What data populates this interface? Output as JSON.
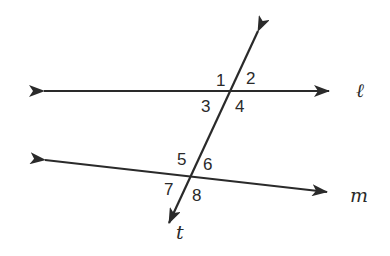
{
  "diagram": {
    "type": "parallel lines cut by a transversal",
    "lines": [
      {
        "name": "ℓ",
        "label": "ℓ",
        "from": [
          25,
          91
        ],
        "to": [
          348,
          91
        ],
        "arrows": "both"
      },
      {
        "name": "m",
        "label": "m",
        "from": [
          27,
          158
        ],
        "to": [
          345,
          194
        ],
        "arrows": "both"
      },
      {
        "name": "t",
        "label": "t",
        "from": [
          265,
          15
        ],
        "to": [
          161,
          240
        ],
        "arrows": "both"
      }
    ],
    "intersections": [
      {
        "lines": [
          "ℓ",
          "t"
        ],
        "point": [
          230,
          91
        ],
        "angles": [
          "1",
          "2",
          "3",
          "4"
        ]
      },
      {
        "lines": [
          "m",
          "t"
        ],
        "point": [
          191,
          176
        ],
        "angles": [
          "5",
          "6",
          "7",
          "8"
        ]
      }
    ],
    "angle_labels": {
      "a1": "1",
      "a2": "2",
      "a3": "3",
      "a4": "4",
      "a5": "5",
      "a6": "6",
      "a7": "7",
      "a8": "8"
    },
    "line_labels": {
      "l": "ℓ",
      "m": "m",
      "t": "t"
    },
    "colors": {
      "stroke": "#2a2a2a",
      "background": "#ffffff"
    }
  }
}
